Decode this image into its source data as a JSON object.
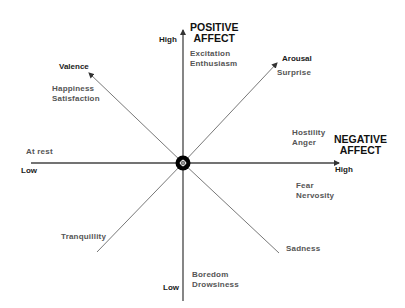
{
  "axes": {
    "vertical": {
      "title_line1": "POSITIVE",
      "title_line2": "AFFECT",
      "high_label": "High",
      "low_label": "Low"
    },
    "horizontal": {
      "title_line1": "NEGATIVE",
      "title_line2": "AFFECT",
      "high_label": "High",
      "low_label": "Low"
    },
    "diagonal_upper_left": {
      "label": "Valence"
    },
    "diagonal_upper_right": {
      "label": "Arousal"
    }
  },
  "emotions": {
    "top": [
      "Excitation",
      "Enthusiasm"
    ],
    "upper_left": [
      "Happiness",
      "Satisfaction"
    ],
    "upper_right": [
      "Surprise"
    ],
    "left": [
      "At rest"
    ],
    "right_upper": [
      "Hostility",
      "Anger"
    ],
    "right_lower": [
      "Fear",
      "Nervosity"
    ],
    "lower_left": [
      "Tranquillity"
    ],
    "lower_right": [
      "Sadness"
    ],
    "bottom": [
      "Boredom",
      "Drowsiness"
    ]
  },
  "colors": {
    "line": "#444444",
    "center": "#000000",
    "emotion_text": "#555555",
    "title_text": "#111111"
  }
}
